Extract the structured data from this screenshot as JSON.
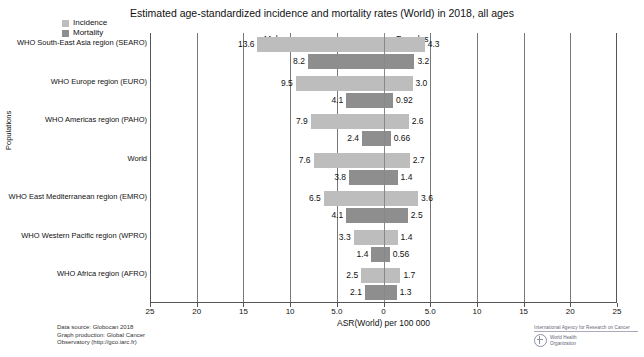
{
  "chart_data": {
    "type": "bar",
    "title": "Estimated age-standardized incidence and mortality rates (World) in 2018, all ages",
    "xlabel": "ASR(World) per 100 000",
    "ylabel": "Populations",
    "orientation": "horizontal-diverging",
    "panels": [
      "Males",
      "Females"
    ],
    "legend": [
      {
        "name": "Incidence",
        "color": "#bdbdbd"
      },
      {
        "name": "Mortality",
        "color": "#8e8e8e"
      }
    ],
    "legend_position": "top-left",
    "grid": true,
    "xlim": [
      -25,
      25
    ],
    "xticks": [
      -25,
      -20,
      -15,
      -10,
      -5,
      0,
      5,
      10,
      15,
      20,
      25
    ],
    "xticklabels": [
      "25",
      "20",
      "15",
      "10",
      "5.0",
      "0",
      "5.0",
      "10",
      "15",
      "20",
      "25"
    ],
    "categories": [
      "WHO South-East Asia region (SEARO)",
      "WHO Europe region (EURO)",
      "WHO Americas region (PAHO)",
      "World",
      "WHO East Mediterranean region (EMRO)",
      "WHO Western Pacific region (WPRO)",
      "WHO Africa region (AFRO)"
    ],
    "series": [
      {
        "name": "Males Incidence",
        "panel": "Males",
        "measure": "Incidence",
        "values": [
          13.6,
          9.5,
          7.9,
          7.6,
          6.5,
          3.3,
          2.5
        ]
      },
      {
        "name": "Males Mortality",
        "panel": "Males",
        "measure": "Mortality",
        "values": [
          8.2,
          4.1,
          2.4,
          3.8,
          4.1,
          1.4,
          2.1
        ]
      },
      {
        "name": "Females Incidence",
        "panel": "Females",
        "measure": "Incidence",
        "values": [
          4.3,
          3.0,
          2.6,
          2.7,
          3.6,
          1.4,
          1.7
        ]
      },
      {
        "name": "Females Mortality",
        "panel": "Females",
        "measure": "Mortality",
        "values": [
          3.2,
          0.92,
          0.66,
          1.4,
          2.5,
          0.56,
          1.3
        ]
      }
    ],
    "rows": [
      {
        "category": "WHO South-East Asia region (SEARO)",
        "male_incidence": "13.6",
        "male_mortality": "8.2",
        "female_incidence": "4.3",
        "female_mortality": "3.2"
      },
      {
        "category": "WHO Europe region (EURO)",
        "male_incidence": "9.5",
        "male_mortality": "4.1",
        "female_incidence": "3.0",
        "female_mortality": "0.92"
      },
      {
        "category": "WHO Americas region (PAHO)",
        "male_incidence": "7.9",
        "male_mortality": "2.4",
        "female_incidence": "2.6",
        "female_mortality": "0.66"
      },
      {
        "category": "World",
        "male_incidence": "7.6",
        "male_mortality": "3.8",
        "female_incidence": "2.7",
        "female_mortality": "1.4"
      },
      {
        "category": "WHO East Mediterranean region (EMRO)",
        "male_incidence": "6.5",
        "male_mortality": "4.1",
        "female_incidence": "3.6",
        "female_mortality": "2.5"
      },
      {
        "category": "WHO Western Pacific region (WPRO)",
        "male_incidence": "3.3",
        "male_mortality": "1.4",
        "female_incidence": "1.4",
        "female_mortality": "0.56"
      },
      {
        "category": "WHO Africa region (AFRO)",
        "male_incidence": "2.5",
        "male_mortality": "2.1",
        "female_incidence": "1.7",
        "female_mortality": "1.3"
      }
    ]
  },
  "footer": {
    "source_line_1": "Data source: Globocan 2018",
    "source_line_2": "Graph production: Global Cancer",
    "source_line_3": "Observatory (http://gco.iarc.fr)",
    "agency": "International Agency for Research on Cancer",
    "who_line_1": "World Health",
    "who_line_2": "Organization"
  }
}
